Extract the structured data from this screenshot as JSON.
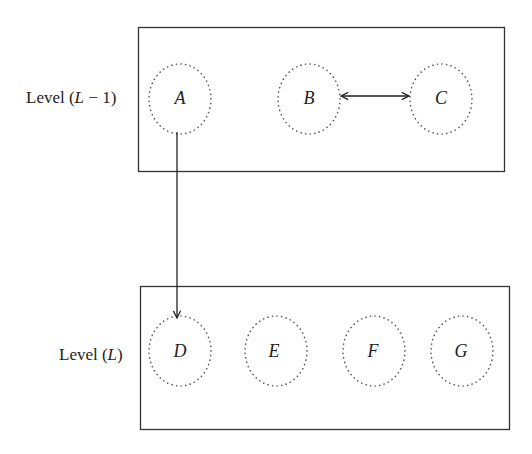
{
  "levels": [
    {
      "id": "upper",
      "label_prefix": "Level (",
      "label_var": "L",
      "label_suffix": " − 1)",
      "nodes": [
        "A",
        "B",
        "C"
      ]
    },
    {
      "id": "lower",
      "label_prefix": "Level (",
      "label_var": "L",
      "label_suffix": ")",
      "nodes": [
        "D",
        "E",
        "F",
        "G"
      ]
    }
  ],
  "nodes": {
    "A": "A",
    "B": "B",
    "C": "C",
    "D": "D",
    "E": "E",
    "F": "F",
    "G": "G"
  },
  "edges": [
    {
      "from": "A",
      "to": "D",
      "type": "directed",
      "label": ""
    },
    {
      "from": "B",
      "to": "C",
      "type": "bidirectional",
      "label": ""
    }
  ]
}
